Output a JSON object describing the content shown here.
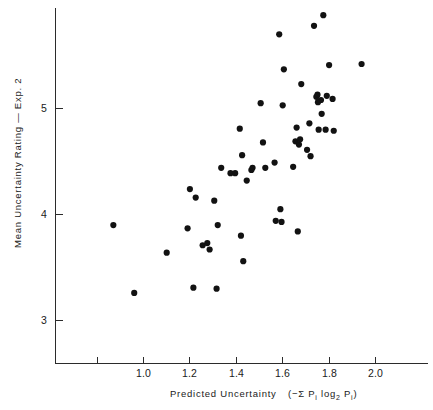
{
  "chart_data": {
    "type": "scatter",
    "title": "",
    "xlabel": "Predicted Uncertainty",
    "xlabel_formula": "(−Σ Pᵢ log₂ Pᵢ)",
    "ylabel": "Mean Uncertainty Rating — Exp. 2",
    "xlim": [
      0.78,
      2.12
    ],
    "ylim": [
      2.55,
      5.93
    ],
    "xticks": [
      1.0,
      1.2,
      1.4,
      1.6,
      1.8,
      2.0
    ],
    "xtick_labels": [
      "1.0",
      "1.2",
      "1.4",
      "1.6",
      "1.8",
      "2.0"
    ],
    "yticks": [
      3,
      4,
      5
    ],
    "ytick_labels": [
      "3",
      "4",
      "5"
    ],
    "grid": false,
    "legend": null,
    "marker": "filled-circle",
    "marker_color": "#121212",
    "marker_size_px": 3.1,
    "n_points": 74,
    "points": [
      {
        "x": 0.87,
        "y": 3.9
      },
      {
        "x": 0.96,
        "y": 3.26
      },
      {
        "x": 1.1,
        "y": 3.64
      },
      {
        "x": 1.19,
        "y": 3.87
      },
      {
        "x": 1.2,
        "y": 4.24
      },
      {
        "x": 1.215,
        "y": 3.31
      },
      {
        "x": 1.225,
        "y": 4.16
      },
      {
        "x": 1.255,
        "y": 3.71
      },
      {
        "x": 1.275,
        "y": 3.73
      },
      {
        "x": 1.285,
        "y": 3.67
      },
      {
        "x": 1.305,
        "y": 4.13
      },
      {
        "x": 1.315,
        "y": 3.3
      },
      {
        "x": 1.32,
        "y": 3.9
      },
      {
        "x": 1.335,
        "y": 4.44
      },
      {
        "x": 1.375,
        "y": 4.39
      },
      {
        "x": 1.395,
        "y": 4.39
      },
      {
        "x": 1.415,
        "y": 4.81
      },
      {
        "x": 1.42,
        "y": 3.8
      },
      {
        "x": 1.425,
        "y": 4.56
      },
      {
        "x": 1.43,
        "y": 3.56
      },
      {
        "x": 1.445,
        "y": 4.32
      },
      {
        "x": 1.465,
        "y": 4.42
      },
      {
        "x": 1.47,
        "y": 4.44
      },
      {
        "x": 1.505,
        "y": 5.05
      },
      {
        "x": 1.515,
        "y": 4.68
      },
      {
        "x": 1.525,
        "y": 4.44
      },
      {
        "x": 1.565,
        "y": 4.49
      },
      {
        "x": 1.57,
        "y": 3.94
      },
      {
        "x": 1.585,
        "y": 5.7
      },
      {
        "x": 1.59,
        "y": 4.05
      },
      {
        "x": 1.595,
        "y": 3.93
      },
      {
        "x": 1.6,
        "y": 5.03
      },
      {
        "x": 1.605,
        "y": 5.37
      },
      {
        "x": 1.645,
        "y": 4.45
      },
      {
        "x": 1.655,
        "y": 4.69
      },
      {
        "x": 1.66,
        "y": 4.82
      },
      {
        "x": 1.665,
        "y": 3.84
      },
      {
        "x": 1.67,
        "y": 4.66
      },
      {
        "x": 1.675,
        "y": 4.71
      },
      {
        "x": 1.68,
        "y": 5.23
      },
      {
        "x": 1.705,
        "y": 4.61
      },
      {
        "x": 1.715,
        "y": 4.86
      },
      {
        "x": 1.72,
        "y": 4.55
      },
      {
        "x": 1.735,
        "y": 5.78
      },
      {
        "x": 1.745,
        "y": 5.11
      },
      {
        "x": 1.75,
        "y": 5.13
      },
      {
        "x": 1.752,
        "y": 5.06
      },
      {
        "x": 1.755,
        "y": 4.8
      },
      {
        "x": 1.765,
        "y": 5.08
      },
      {
        "x": 1.768,
        "y": 4.95
      },
      {
        "x": 1.775,
        "y": 5.88
      },
      {
        "x": 1.785,
        "y": 4.8
      },
      {
        "x": 1.79,
        "y": 5.12
      },
      {
        "x": 1.8,
        "y": 5.41
      },
      {
        "x": 1.815,
        "y": 5.09
      },
      {
        "x": 1.82,
        "y": 4.79
      },
      {
        "x": 1.94,
        "y": 5.42
      }
    ]
  },
  "axis": {
    "x_title": "Predicted Uncertainty",
    "x_formula_open": "(−Σ P",
    "x_formula_sub1": "i",
    "x_formula_mid": " log",
    "x_formula_sub2": "2",
    "x_formula_p2": " P",
    "x_formula_sub3": "i",
    "x_formula_close": ")",
    "y_title": "Mean Uncertainty Rating — Exp. 2"
  }
}
